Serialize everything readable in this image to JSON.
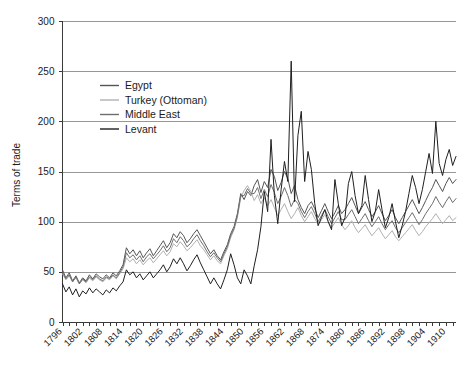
{
  "chart_data": {
    "type": "line",
    "title": "",
    "subtitle": "",
    "xlabel": "",
    "ylabel": "Terms of trade",
    "xlim": [
      1796,
      1913
    ],
    "ylim": [
      0,
      300
    ],
    "ytick_values": [
      0,
      50,
      100,
      150,
      200,
      250,
      300
    ],
    "ytick_labels": [
      "0",
      "50",
      "100",
      "150",
      "200",
      "250",
      "300"
    ],
    "xtick_values": [
      1796,
      1802,
      1808,
      1814,
      1820,
      1826,
      1832,
      1838,
      1844,
      1850,
      1856,
      1862,
      1868,
      1874,
      1880,
      1886,
      1892,
      1898,
      1904,
      1910
    ],
    "xtick_labels": [
      "1796",
      "1802",
      "1808",
      "1814",
      "1820",
      "1826",
      "1832",
      "1838",
      "1844",
      "1850",
      "1856",
      "1862",
      "1868",
      "1874",
      "1880",
      "1886",
      "1892",
      "1898",
      "1904",
      "1910"
    ],
    "grid": "horizontal",
    "legend_position": "upper-left-inside",
    "x_start": 1796,
    "x_step": 1,
    "series": [
      {
        "name": "Egypt",
        "color": "#555555",
        "values": [
          52,
          44,
          49,
          41,
          46,
          39,
          44,
          41,
          47,
          43,
          48,
          45,
          43,
          47,
          44,
          49,
          46,
          51,
          57,
          74,
          68,
          72,
          66,
          71,
          64,
          69,
          73,
          66,
          71,
          76,
          81,
          74,
          79,
          88,
          84,
          90,
          86,
          79,
          83,
          88,
          92,
          86,
          80,
          74,
          68,
          72,
          66,
          62,
          70,
          77,
          88,
          95,
          108,
          128,
          122,
          130,
          126,
          136,
          142,
          129,
          140,
          134,
          152,
          145,
          131,
          139,
          150,
          143,
          128,
          136,
          122,
          114,
          108,
          116,
          120,
          113,
          104,
          111,
          118,
          110,
          103,
          109,
          116,
          108,
          112,
          118,
          124,
          116,
          108,
          114,
          120,
          112,
          105,
          110,
          116,
          108,
          101,
          106,
          112,
          104,
          98,
          104,
          110,
          116,
          122,
          115,
          108,
          114,
          121,
          128,
          134,
          142,
          136,
          130,
          138,
          144,
          138,
          142
        ]
      },
      {
        "name": "Turkey (Ottoman)",
        "color": "#b0b0b0",
        "values": [
          48,
          42,
          46,
          40,
          44,
          38,
          42,
          39,
          44,
          41,
          45,
          42,
          40,
          44,
          42,
          46,
          43,
          48,
          53,
          64,
          60,
          63,
          58,
          62,
          57,
          61,
          64,
          59,
          63,
          67,
          71,
          66,
          70,
          78,
          75,
          80,
          76,
          71,
          74,
          78,
          82,
          76,
          72,
          67,
          62,
          66,
          61,
          58,
          66,
          73,
          84,
          92,
          104,
          124,
          131,
          136,
          130,
          121,
          127,
          118,
          124,
          116,
          122,
          114,
          106,
          112,
          118,
          110,
          103,
          108,
          114,
          106,
          100,
          105,
          110,
          103,
          97,
          102,
          107,
          100,
          94,
          99,
          104,
          97,
          92,
          96,
          101,
          94,
          89,
          93,
          97,
          91,
          86,
          90,
          94,
          88,
          83,
          87,
          91,
          85,
          81,
          85,
          89,
          93,
          97,
          91,
          86,
          90,
          95,
          99,
          103,
          108,
          103,
          98,
          102,
          106,
          101,
          104
        ]
      },
      {
        "name": "Middle East",
        "color": "#6e6e6e",
        "values": [
          50,
          43,
          47,
          40,
          45,
          38,
          43,
          40,
          45,
          42,
          46,
          43,
          41,
          45,
          43,
          47,
          44,
          49,
          55,
          69,
          64,
          67,
          62,
          66,
          60,
          65,
          68,
          63,
          67,
          71,
          76,
          70,
          74,
          83,
          79,
          85,
          81,
          75,
          78,
          83,
          87,
          81,
          76,
          70,
          65,
          69,
          64,
          60,
          68,
          75,
          86,
          93,
          106,
          126,
          126,
          133,
          128,
          128,
          134,
          123,
          132,
          125,
          137,
          129,
          118,
          125,
          134,
          126,
          115,
          122,
          118,
          110,
          104,
          110,
          115,
          108,
          100,
          106,
          112,
          105,
          98,
          104,
          110,
          102,
          102,
          107,
          112,
          105,
          98,
          103,
          108,
          101,
          95,
          100,
          105,
          98,
          92,
          97,
          101,
          94,
          89,
          94,
          99,
          104,
          109,
          103,
          97,
          102,
          108,
          113,
          118,
          125,
          119,
          114,
          120,
          125,
          119,
          123
        ]
      },
      {
        "name": "Levant",
        "color": "#1f1f1f",
        "values": [
          38,
          30,
          35,
          27,
          33,
          25,
          31,
          28,
          34,
          29,
          33,
          30,
          27,
          32,
          29,
          34,
          31,
          36,
          40,
          52,
          47,
          50,
          44,
          48,
          42,
          46,
          50,
          44,
          48,
          52,
          57,
          50,
          55,
          63,
          58,
          64,
          58,
          51,
          56,
          62,
          67,
          59,
          52,
          45,
          38,
          44,
          38,
          33,
          42,
          52,
          68,
          57,
          44,
          38,
          52,
          46,
          38,
          56,
          72,
          95,
          130,
          110,
          182,
          126,
          98,
          132,
          160,
          140,
          260,
          120,
          186,
          210,
          140,
          170,
          152,
          118,
          96,
          104,
          112,
          100,
          92,
          142,
          118,
          96,
          104,
          138,
          150,
          126,
          108,
          116,
          146,
          122,
          100,
          110,
          132,
          112,
          94,
          104,
          118,
          100,
          84,
          96,
          110,
          128,
          146,
          134,
          118,
          132,
          150,
          168,
          148,
          200,
          158,
          146,
          162,
          172,
          156,
          165
        ]
      }
    ]
  },
  "legend": {
    "entries": [
      {
        "label": "Egypt",
        "color": "#555555"
      },
      {
        "label": "Turkey (Ottoman)",
        "color": "#b0b0b0"
      },
      {
        "label": "Middle East",
        "color": "#6e6e6e"
      },
      {
        "label": "Levant",
        "color": "#1f1f1f"
      }
    ]
  },
  "axes": {
    "y_title": "Terms of trade"
  }
}
